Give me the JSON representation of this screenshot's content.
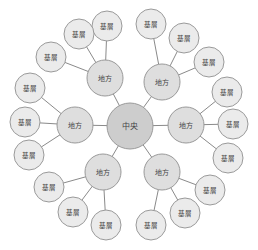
{
  "diagram": {
    "title": "",
    "colors": {
      "center_fill": "#cdcdcd",
      "local_fill": "#dedede",
      "base_fill": "#ebebeb",
      "stroke": "#9a9a9a",
      "edge": "#8a8a8a",
      "text": "#444444"
    },
    "center": {
      "label": "中央",
      "x": 130,
      "y": 126,
      "r": 23
    },
    "locals": [
      {
        "label": "地方",
        "x": 105,
        "y": 78,
        "r": 18,
        "bases": [
          {
            "label": "基層",
            "x": 107,
            "y": 26
          },
          {
            "label": "基層",
            "x": 79,
            "y": 34
          },
          {
            "label": "基層",
            "x": 51,
            "y": 57
          }
        ]
      },
      {
        "label": "地方",
        "x": 162,
        "y": 82,
        "r": 18,
        "bases": [
          {
            "label": "基層",
            "x": 151,
            "y": 24
          },
          {
            "label": "基層",
            "x": 184,
            "y": 38
          },
          {
            "label": "基層",
            "x": 209,
            "y": 62
          }
        ]
      },
      {
        "label": "地方",
        "x": 75,
        "y": 125,
        "r": 18,
        "bases": [
          {
            "label": "基層",
            "x": 30,
            "y": 88
          },
          {
            "label": "基層",
            "x": 25,
            "y": 122
          },
          {
            "label": "基層",
            "x": 29,
            "y": 155
          }
        ]
      },
      {
        "label": "地方",
        "x": 186,
        "y": 125,
        "r": 18,
        "bases": [
          {
            "label": "基層",
            "x": 227,
            "y": 92
          },
          {
            "label": "基層",
            "x": 233,
            "y": 124
          },
          {
            "label": "基層",
            "x": 228,
            "y": 158
          }
        ]
      },
      {
        "label": "地方",
        "x": 103,
        "y": 172,
        "r": 18,
        "bases": [
          {
            "label": "基層",
            "x": 49,
            "y": 187
          },
          {
            "label": "基層",
            "x": 73,
            "y": 212
          },
          {
            "label": "基層",
            "x": 106,
            "y": 225
          }
        ]
      },
      {
        "label": "地方",
        "x": 162,
        "y": 172,
        "r": 18,
        "bases": [
          {
            "label": "基層",
            "x": 151,
            "y": 225
          },
          {
            "label": "基層",
            "x": 185,
            "y": 213
          },
          {
            "label": "基層",
            "x": 210,
            "y": 190
          }
        ]
      }
    ],
    "base_r": 15
  }
}
